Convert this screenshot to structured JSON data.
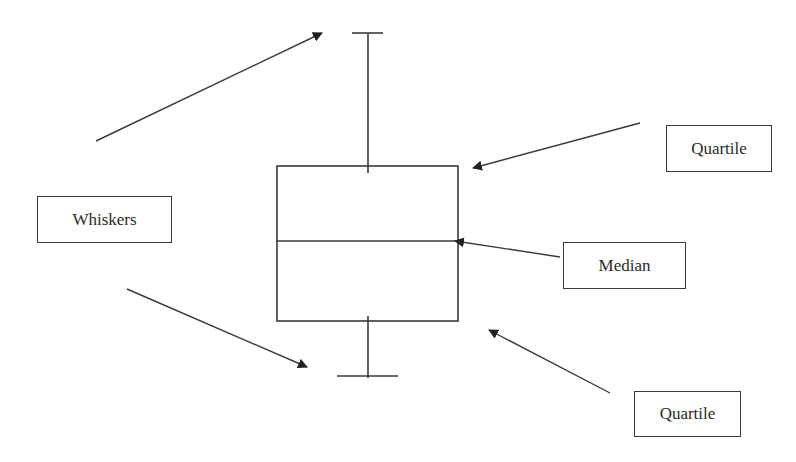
{
  "diagram": {
    "stroke_color": "#3a3a3a",
    "background": "#ffffff",
    "labels": {
      "whiskers": "Whiskers",
      "quartile_upper": "Quartile",
      "median": "Median",
      "quartile_lower": "Quartile"
    },
    "boxplot": {
      "upper_whisker_cap_y": 33,
      "upper_quartile_y": 166,
      "median_y": 241,
      "lower_quartile_y": 321,
      "lower_whisker_cap_y": 376,
      "box_left_x": 277,
      "box_right_x": 458
    },
    "arrows": [
      {
        "from": "whiskers",
        "to": "upper-whisker"
      },
      {
        "from": "whiskers",
        "to": "lower-whisker"
      },
      {
        "from": "quartile_upper",
        "to": "upper-quartile"
      },
      {
        "from": "median",
        "to": "median-line"
      },
      {
        "from": "quartile_lower",
        "to": "lower-quartile"
      }
    ]
  }
}
